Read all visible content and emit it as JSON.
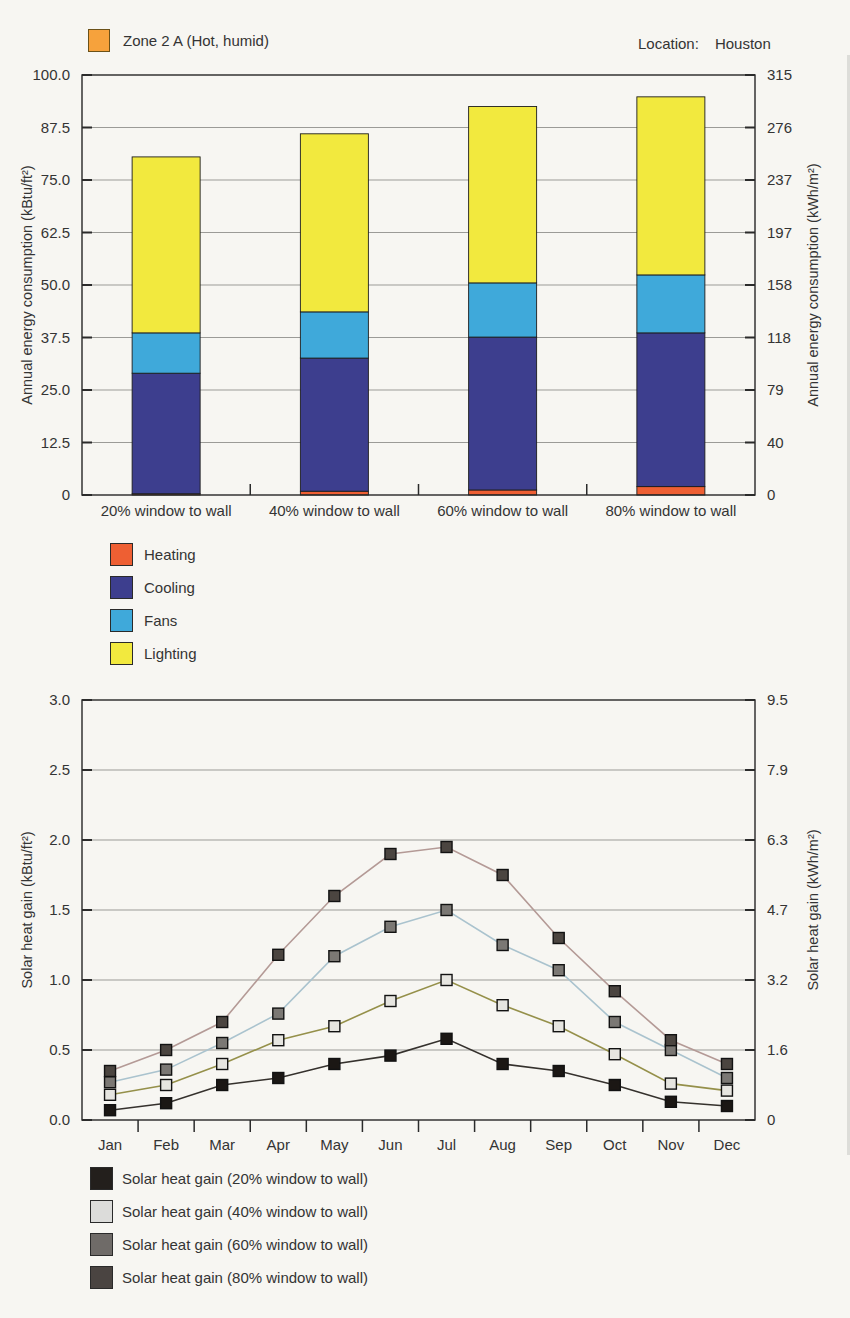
{
  "header": {
    "zone_swatch_color": "#f6a23c",
    "zone_label": "Zone 2 A (Hot, humid)",
    "location_label": "Location:",
    "location_value": "Houston"
  },
  "energy_legend": {
    "items": [
      {
        "label": "Heating",
        "color": "#ee5f33"
      },
      {
        "label": "Cooling",
        "color": "#3d3e8e"
      },
      {
        "label": "Fans",
        "color": "#3fa9da"
      },
      {
        "label": "Lighting",
        "color": "#f2e93e"
      }
    ]
  },
  "solar_legend": {
    "items": [
      {
        "label": "Solar heat gain (20% window to wall)",
        "color": "#231f1c"
      },
      {
        "label": "Solar heat gain (40% window to wall)",
        "color": "#dcdcda"
      },
      {
        "label": "Solar heat gain (60% window to wall)",
        "color": "#6f6b68"
      },
      {
        "label": "Solar heat gain (80% window to wall)",
        "color": "#4a4441"
      }
    ]
  },
  "chart_data": [
    {
      "type": "bar",
      "stacked": true,
      "categories": [
        "20% window to wall",
        "40% window to wall",
        "60% window to wall",
        "80% window to wall"
      ],
      "series": [
        {
          "name": "Heating",
          "color": "#ee5f33",
          "values": [
            0.3,
            0.9,
            1.2,
            2.0
          ]
        },
        {
          "name": "Cooling",
          "color": "#3d3e8e",
          "values": [
            28.7,
            31.7,
            36.4,
            36.6
          ]
        },
        {
          "name": "Fans",
          "color": "#3fa9da",
          "values": [
            9.6,
            11.0,
            12.9,
            13.8
          ]
        },
        {
          "name": "Lighting",
          "color": "#f2e93e",
          "values": [
            41.9,
            42.4,
            42.0,
            42.4
          ]
        }
      ],
      "totals": [
        80.5,
        86.0,
        92.5,
        94.8
      ],
      "ylabel_left": "Annual energy consumption (kBtu/ft²)",
      "ylabel_right": "Annual energy consumption (kWh/m²)",
      "yticks_left": [
        "0",
        "12.5",
        "25.0",
        "37.5",
        "50.0",
        "62.5",
        "75.0",
        "87.5",
        "100.0"
      ],
      "yticks_right": [
        "0",
        "40",
        "79",
        "118",
        "158",
        "197",
        "237",
        "276",
        "315"
      ],
      "ylim": [
        0,
        100
      ],
      "grid": true,
      "legend_position": "below"
    },
    {
      "type": "line",
      "x": [
        "Jan",
        "Feb",
        "Mar",
        "Apr",
        "May",
        "Jun",
        "Jul",
        "Aug",
        "Sep",
        "Oct",
        "Nov",
        "Dec"
      ],
      "series": [
        {
          "name": "Solar heat gain (20% window to wall)",
          "line_color": "#35312d",
          "marker_color": "#1b1714",
          "values": [
            0.07,
            0.12,
            0.25,
            0.3,
            0.4,
            0.46,
            0.58,
            0.4,
            0.35,
            0.25,
            0.13,
            0.1
          ]
        },
        {
          "name": "Solar heat gain (40% window to wall)",
          "line_color": "#95904a",
          "marker_color": "#e6e5e0",
          "values": [
            0.18,
            0.25,
            0.4,
            0.57,
            0.67,
            0.85,
            1.0,
            0.82,
            0.67,
            0.47,
            0.26,
            0.21
          ]
        },
        {
          "name": "Solar heat gain (60% window to wall)",
          "line_color": "#aac3ce",
          "marker_color": "#7b7874",
          "values": [
            0.27,
            0.36,
            0.55,
            0.76,
            1.17,
            1.38,
            1.5,
            1.25,
            1.07,
            0.7,
            0.5,
            0.3
          ]
        },
        {
          "name": "Solar heat gain (80% window to wall)",
          "line_color": "#b49a96",
          "marker_color": "#4b4540",
          "values": [
            0.35,
            0.5,
            0.7,
            1.18,
            1.6,
            1.9,
            1.95,
            1.75,
            1.3,
            0.92,
            0.57,
            0.4
          ]
        }
      ],
      "ylabel_left": "Solar heat gain (kBtu/ft²)",
      "ylabel_right": "Solar heat gain (kWh/m²)",
      "yticks_left": [
        "0.0",
        "0.5",
        "1.0",
        "1.5",
        "2.0",
        "2.5",
        "3.0"
      ],
      "yticks_right": [
        "0",
        "1.6",
        "3.2",
        "4.7",
        "6.3",
        "7.9",
        "9.5"
      ],
      "ylim": [
        0,
        3
      ],
      "grid": true,
      "legend_position": "below"
    }
  ]
}
